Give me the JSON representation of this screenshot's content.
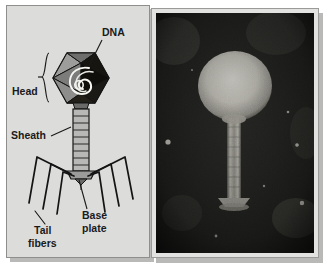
{
  "figure": {
    "kind": "bacteriophage-anatomy-figure",
    "panels": [
      "labeled-diagram",
      "electron-micrograph"
    ]
  },
  "diagram": {
    "background_color": "#dcdcda",
    "border_color": "#8e8e8c",
    "stroke_color": "#1a1a1a",
    "labels": [
      {
        "id": "dna",
        "text": "DNA",
        "x": 95,
        "y": 30,
        "anchor": "start"
      },
      {
        "id": "head",
        "text": "Head",
        "x": 5,
        "y": 89,
        "anchor": "start"
      },
      {
        "id": "sheath",
        "text": "Sheath",
        "x": 4,
        "y": 133,
        "anchor": "start"
      },
      {
        "id": "base_plate_1",
        "text": "Base",
        "x": 75,
        "y": 213,
        "anchor": "start"
      },
      {
        "id": "base_plate_2",
        "text": "plate",
        "x": 75,
        "y": 226,
        "anchor": "start"
      },
      {
        "id": "tail_fibers_1",
        "text": "Tail",
        "x": 27,
        "y": 228,
        "anchor": "start"
      },
      {
        "id": "tail_fibers_2",
        "text": "fibers",
        "x": 21,
        "y": 241,
        "anchor": "start"
      }
    ],
    "parts": {
      "head": {
        "name": "icosahedral-capsid",
        "fill_dark": "#14110f",
        "fill_light": "#8d8d8b"
      },
      "dna": {
        "name": "coiled-dna-strand",
        "stroke": "#f2f2f0"
      },
      "sheath": {
        "name": "contractile-tail-sheath",
        "bands": 9,
        "fill": "#b5b5b3"
      },
      "base_plate": {
        "name": "base-plate",
        "fill": "#9a9a98"
      },
      "tail_fibers": {
        "name": "tail-fibers",
        "count": 6
      }
    }
  },
  "micrograph": {
    "kind": "transmission-electron-micrograph",
    "subject": "bacteriophage",
    "frame_color": "#e2e2e0",
    "background_color": "#1b1b1b",
    "features": {
      "head": {
        "name": "phage-head",
        "cx": 79,
        "cy": 73,
        "rx": 36,
        "ry": 34,
        "brightness": "#cfcfc8"
      },
      "tail": {
        "name": "phage-tail",
        "x": 72,
        "y": 106,
        "w": 13,
        "h": 78,
        "brightness": "#a8a8a0"
      },
      "base_plate": {
        "name": "phage-base-plate",
        "cx": 78,
        "cy": 187,
        "w": 30,
        "h": 9
      }
    }
  }
}
